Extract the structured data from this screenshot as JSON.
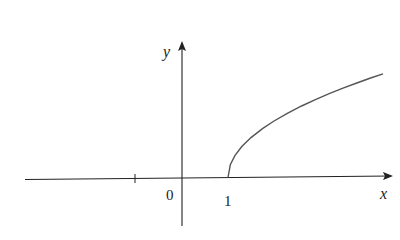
{
  "chart_data": {
    "type": "line",
    "title": "",
    "function": "y = sqrt(x - 1)",
    "xlabel": "x",
    "ylabel": "y",
    "tick_labels": {
      "origin": "0",
      "x_one": "1"
    },
    "x_ticks": [
      -1,
      1
    ],
    "xlim": [
      -3.4,
      4.6
    ],
    "ylim": [
      -0.8,
      2.4
    ],
    "grid": false,
    "legend": null,
    "series": [
      {
        "name": "sqrt(x-1)",
        "x": [
          1.0,
          1.05,
          1.15,
          1.3,
          1.5,
          1.75,
          2.0,
          2.3,
          2.6,
          2.9,
          3.2,
          3.5,
          3.8,
          4.1,
          4.37
        ],
        "y": [
          0.0,
          0.224,
          0.387,
          0.548,
          0.707,
          0.866,
          1.0,
          1.14,
          1.265,
          1.378,
          1.483,
          1.581,
          1.673,
          1.761,
          1.836
        ]
      }
    ],
    "colors": {
      "axis": "#222222",
      "curve": "#555555",
      "background": "#ffffff"
    }
  }
}
